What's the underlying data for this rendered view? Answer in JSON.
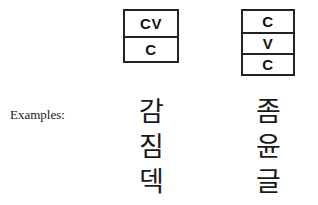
{
  "figure": {
    "examples_label": "Examples:",
    "structures": [
      {
        "name": "cv-c",
        "cells": [
          "CV",
          "C"
        ]
      },
      {
        "name": "c-v-c",
        "cells": [
          "C",
          "V",
          "C"
        ]
      }
    ],
    "example_columns": [
      {
        "structure": "cv-c",
        "syllables": [
          "감",
          "짐",
          "덱"
        ]
      },
      {
        "structure": "c-v-c",
        "syllables": [
          "좀",
          "윤",
          "글"
        ]
      }
    ]
  },
  "colors": {
    "background": "#ffffff",
    "ink": "#1a1a1a",
    "box_border": "#222222"
  }
}
